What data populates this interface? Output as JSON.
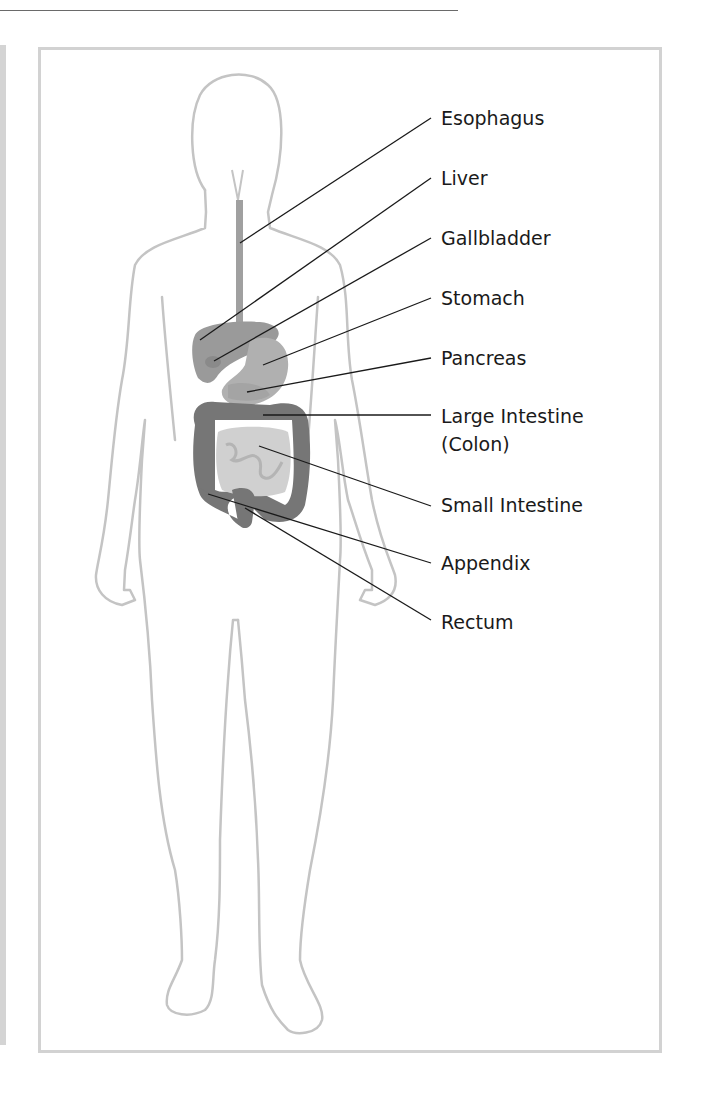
{
  "diagram": {
    "type": "anatomical-labeled-illustration",
    "colors": {
      "body_outline": "#c4c4c4",
      "frame_border": "#d2d2d2",
      "leader_line": "#1a1a1a",
      "liver": "#9a9a9a",
      "stomach": "#a8a8a8",
      "large_intestine": "#767676",
      "small_intestine": "#d0d0d0",
      "esophagus": "#a0a0a0"
    },
    "labels": [
      {
        "id": "esophagus",
        "text": "Esophagus"
      },
      {
        "id": "liver",
        "text": "Liver"
      },
      {
        "id": "gallbladder",
        "text": "Gallbladder"
      },
      {
        "id": "stomach",
        "text": "Stomach"
      },
      {
        "id": "pancreas",
        "text": "Pancreas"
      },
      {
        "id": "large-intestine",
        "text": "Large Intestine",
        "subtext": "(Colon)"
      },
      {
        "id": "small-intestine",
        "text": "Small Intestine"
      },
      {
        "id": "appendix",
        "text": "Appendix"
      },
      {
        "id": "rectum",
        "text": "Rectum"
      }
    ]
  }
}
